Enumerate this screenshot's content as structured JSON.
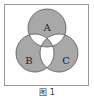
{
  "diagram": {
    "type": "venn",
    "sets": [
      {
        "id": "A",
        "label": "A",
        "cx": 47,
        "cy": 28,
        "r": 19
      },
      {
        "id": "B",
        "label": "B",
        "cx": 35,
        "cy": 53,
        "r": 19
      },
      {
        "id": "C",
        "label": "C",
        "cx": 59,
        "cy": 53,
        "r": 19
      }
    ],
    "shaded_regions": [
      "A only",
      "B only",
      "C only",
      "A∩B∩C"
    ],
    "unshaded_regions": [
      "A∩B only",
      "A∩C only",
      "B∩C only"
    ],
    "colors": {
      "shade": "#a8a8a8",
      "unshaded": "#ffffff",
      "stroke": "#555555",
      "frame": "#999999"
    }
  },
  "caption": "图 1"
}
